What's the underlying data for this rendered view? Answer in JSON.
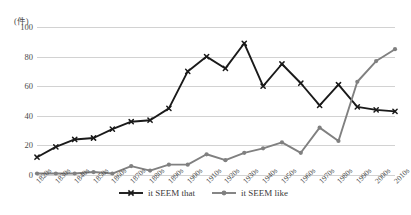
{
  "chart_data": {
    "type": "line",
    "title": "",
    "xlabel": "",
    "ylabel": "(件)",
    "ylim": [
      0,
      100
    ],
    "yticks": [
      0,
      20,
      40,
      60,
      80,
      100
    ],
    "grid": true,
    "legend_position": "bottom",
    "categories": [
      "1820s",
      "1830s",
      "1840s",
      "1850s",
      "1860s",
      "1870s",
      "1880s",
      "1890s",
      "1900s",
      "1910s",
      "1920s",
      "1930s",
      "1940s",
      "1950s",
      "1960s",
      "1970s",
      "1980s",
      "1990s",
      "2000s",
      "2010s"
    ],
    "series": [
      {
        "name": "it SEEM that",
        "color": "#1a1a1a",
        "marker": "x",
        "values": [
          12,
          19,
          24,
          25,
          31,
          36,
          37,
          45,
          70,
          80,
          72,
          89,
          60,
          75,
          62,
          47,
          61,
          46,
          44,
          43
        ]
      },
      {
        "name": "it SEEM like",
        "color": "#808080",
        "marker": "circle",
        "values": [
          1,
          1,
          1,
          2,
          1,
          6,
          3,
          7,
          7,
          14,
          10,
          15,
          18,
          22,
          15,
          32,
          23,
          63,
          77,
          85
        ]
      }
    ]
  },
  "legend": {
    "items": [
      {
        "label": "it SEEM that",
        "marker": "x-marker-icon"
      },
      {
        "label": "it SEEM like",
        "marker": "circle-marker-icon"
      }
    ]
  },
  "colors": {
    "series_black": "#1a1a1a",
    "series_gray": "#808080",
    "gridline": "#d2d2d2",
    "text": "#3a3a3a",
    "background": "#ffffff"
  }
}
